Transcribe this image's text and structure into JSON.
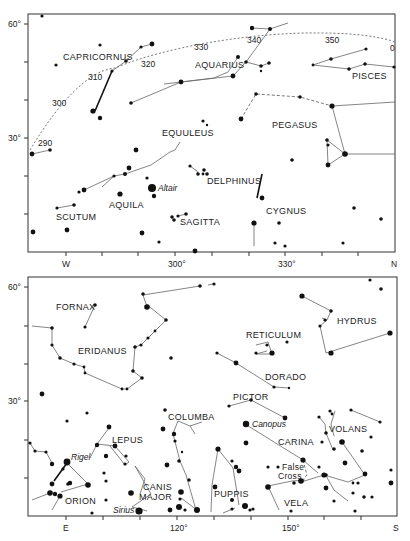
{
  "top_chart": {
    "y_labels": {
      "lat60": "60°",
      "lat30": "30°"
    },
    "x_labels": {
      "w": "W",
      "ra300": "300°",
      "ra330": "330°",
      "n": "N"
    },
    "ecliptic_labels": {
      "e290": "290",
      "e300": "300",
      "e310": "310",
      "e320": "320",
      "e330": "330",
      "e340": "340",
      "e350": "350",
      "e0": "0"
    },
    "constellations": {
      "capricornus": "CAPRICORNUS",
      "aquarius": "AQUARIUS",
      "pisces": "PISCES",
      "equuleus": "EQUULEUS",
      "pegasus": "PEGASUS",
      "delphinus": "DELPHINUS",
      "scutum": "SCUTUM",
      "aquila": "AQUILA",
      "sagitta": "SAGITTA",
      "cygnus": "CYGNUS"
    },
    "stars": {
      "altair": "Altair"
    }
  },
  "bottom_chart": {
    "y_labels": {
      "lat60": "60°",
      "lat30": "30°"
    },
    "x_labels": {
      "e": "E",
      "ra120": "120°",
      "ra150": "150°",
      "s": "S"
    },
    "constellations": {
      "fornax": "FORNAX",
      "eridanus": "ERIDANUS",
      "reticulum": "RETICULUM",
      "hydrus": "HYDRUS",
      "dorado": "DORADO",
      "pictor": "PICTOR",
      "columba": "COLUMBA",
      "lepus": "LEPUS",
      "carina": "CARINA",
      "volans": "VOLANS",
      "orion": "ORION",
      "canis_major_1": "CANIS",
      "canis_major_2": "MAJOR",
      "puppis": "PUPPIS",
      "vela": "VELA",
      "false_cross_1": "False",
      "false_cross_2": "Cross"
    },
    "stars": {
      "rigel": "Rigel",
      "canopus": "Canopus",
      "sirius": "Sirius"
    }
  }
}
